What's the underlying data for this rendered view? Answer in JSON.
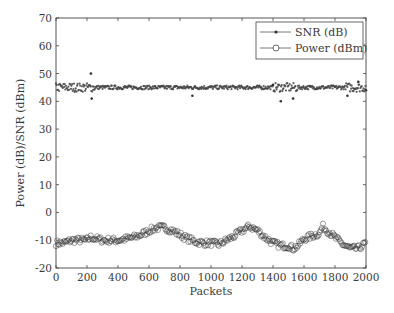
{
  "chart_data": {
    "type": "scatter",
    "title": "",
    "xlabel": "Packets",
    "ylabel": "Power (dB)/SNR (dBm)",
    "xlim": [
      0,
      2000
    ],
    "ylim": [
      -20,
      70
    ],
    "xticks": [
      0,
      200,
      400,
      600,
      800,
      1000,
      1200,
      1400,
      1600,
      1800,
      2000
    ],
    "yticks": [
      -20,
      -10,
      0,
      10,
      20,
      30,
      40,
      50,
      60,
      70
    ],
    "grid": false,
    "legend_position": "upper right",
    "series": [
      {
        "name": "SNR (dB)",
        "marker": "asterisk-dot",
        "x": [
          0,
          100,
          200,
          225,
          230,
          300,
          400,
          500,
          600,
          700,
          800,
          880,
          900,
          1000,
          1100,
          1200,
          1300,
          1400,
          1450,
          1500,
          1530,
          1600,
          1700,
          1800,
          1880,
          1900,
          1950,
          2000
        ],
        "y": [
          45,
          45,
          45,
          50,
          41,
          45,
          45,
          45,
          45,
          45,
          45,
          42,
          45,
          45,
          45,
          45,
          45,
          46,
          40,
          45,
          41,
          45,
          45,
          45,
          42,
          45,
          47,
          44
        ]
      },
      {
        "name": "Power (dBm)",
        "marker": "circle",
        "x": [
          0,
          50,
          100,
          200,
          225,
          300,
          400,
          500,
          550,
          600,
          650,
          700,
          750,
          800,
          850,
          900,
          950,
          1000,
          1050,
          1100,
          1150,
          1200,
          1250,
          1300,
          1350,
          1400,
          1450,
          1500,
          1530,
          1560,
          1600,
          1650,
          1700,
          1720,
          1750,
          1800,
          1850,
          1900,
          1950,
          2000
        ],
        "y": [
          -11,
          -11,
          -10,
          -10,
          -9,
          -10,
          -10,
          -9,
          -8,
          -6.5,
          -5.5,
          -5.5,
          -6.5,
          -8,
          -9.5,
          -10.5,
          -11,
          -11,
          -11.5,
          -10,
          -8.5,
          -6.5,
          -5,
          -6.5,
          -9,
          -11,
          -12,
          -12,
          -13,
          -12,
          -9.5,
          -8.5,
          -7.5,
          -5,
          -6.5,
          -9,
          -11.5,
          -13,
          -13,
          -11
        ]
      }
    ]
  },
  "legend": {
    "items": [
      {
        "label": "SNR (dB)"
      },
      {
        "label": "Power (dBm)"
      }
    ]
  }
}
